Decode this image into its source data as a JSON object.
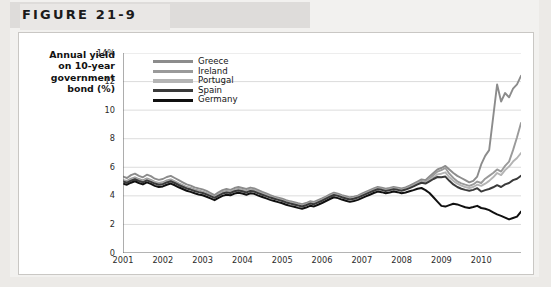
{
  "figure": {
    "label": "FIGURE 21-9"
  },
  "axis_title": {
    "line1": "Annual yield",
    "line2": "on 10-year",
    "line3": "government",
    "line4": "bond (%)"
  },
  "chart_data": {
    "type": "line",
    "title": "FIGURE 21-9",
    "xlabel": "",
    "ylabel": "Annual yield on 10-year government bond (%)",
    "ylim": [
      0,
      14
    ],
    "xlim": [
      2001,
      2011
    ],
    "grid": true,
    "legend_position": "top-left-inside",
    "ytick_labels": [
      "0",
      "2",
      "4",
      "6",
      "8",
      "10",
      "12",
      "14%"
    ],
    "ytick_values": [
      0,
      2,
      4,
      6,
      8,
      10,
      12,
      14
    ],
    "xtick_labels": [
      "2001",
      "2002",
      "2003",
      "2004",
      "2005",
      "2006",
      "2007",
      "2008",
      "2009",
      "2010"
    ],
    "xtick_values": [
      2001,
      2002,
      2003,
      2004,
      2005,
      2006,
      2007,
      2008,
      2009,
      2010
    ],
    "colors": {
      "Greece": "#8c8c8c",
      "Ireland": "#9a9a9a",
      "Portugal": "#b4b4b4",
      "Spain": "#3a3a3a",
      "Germany": "#101010"
    },
    "x": [
      2001.0,
      2001.1,
      2001.2,
      2001.3,
      2001.4,
      2001.5,
      2001.6,
      2001.7,
      2001.8,
      2001.9,
      2002.0,
      2002.1,
      2002.2,
      2002.3,
      2002.4,
      2002.5,
      2002.6,
      2002.7,
      2002.8,
      2002.9,
      2003.0,
      2003.1,
      2003.2,
      2003.3,
      2003.4,
      2003.5,
      2003.6,
      2003.7,
      2003.8,
      2003.9,
      2004.0,
      2004.1,
      2004.2,
      2004.3,
      2004.4,
      2004.5,
      2004.6,
      2004.7,
      2004.8,
      2004.9,
      2005.0,
      2005.1,
      2005.2,
      2005.3,
      2005.4,
      2005.5,
      2005.6,
      2005.7,
      2005.8,
      2005.9,
      2006.0,
      2006.1,
      2006.2,
      2006.3,
      2006.4,
      2006.5,
      2006.6,
      2006.7,
      2006.8,
      2006.9,
      2007.0,
      2007.1,
      2007.2,
      2007.3,
      2007.4,
      2007.5,
      2007.6,
      2007.7,
      2007.8,
      2007.9,
      2008.0,
      2008.1,
      2008.2,
      2008.3,
      2008.4,
      2008.5,
      2008.6,
      2008.7,
      2008.8,
      2008.9,
      2009.0,
      2009.1,
      2009.2,
      2009.3,
      2009.4,
      2009.5,
      2009.6,
      2009.7,
      2009.8,
      2009.9,
      2010.0,
      2010.1,
      2010.2,
      2010.3,
      2010.4,
      2010.5,
      2010.6,
      2010.7,
      2010.8,
      2010.9,
      2011.0
    ],
    "series": [
      {
        "name": "Greece",
        "values": [
          5.35,
          5.25,
          5.45,
          5.55,
          5.4,
          5.3,
          5.48,
          5.38,
          5.2,
          5.12,
          5.18,
          5.32,
          5.4,
          5.25,
          5.1,
          4.95,
          4.8,
          4.72,
          4.6,
          4.52,
          4.45,
          4.35,
          4.2,
          4.05,
          4.25,
          4.4,
          4.48,
          4.42,
          4.55,
          4.62,
          4.55,
          4.48,
          4.58,
          4.52,
          4.4,
          4.28,
          4.18,
          4.05,
          3.95,
          3.88,
          3.8,
          3.7,
          3.62,
          3.55,
          3.48,
          3.42,
          3.5,
          3.62,
          3.58,
          3.7,
          3.82,
          3.95,
          4.1,
          4.22,
          4.15,
          4.05,
          3.98,
          3.9,
          3.95,
          4.02,
          4.15,
          4.28,
          4.4,
          4.52,
          4.62,
          4.58,
          4.5,
          4.55,
          4.62,
          4.58,
          4.52,
          4.6,
          4.72,
          4.85,
          5.0,
          5.15,
          5.1,
          5.35,
          5.6,
          5.85,
          5.95,
          6.1,
          5.85,
          5.6,
          5.4,
          5.25,
          5.1,
          4.95,
          5.05,
          5.35,
          6.2,
          6.8,
          7.2,
          9.5,
          11.8,
          10.6,
          11.2,
          10.9,
          11.5,
          11.8,
          12.4
        ]
      },
      {
        "name": "Ireland",
        "values": [
          5.1,
          5.05,
          5.2,
          5.3,
          5.18,
          5.08,
          5.22,
          5.12,
          4.98,
          4.9,
          4.95,
          5.08,
          5.15,
          5.02,
          4.88,
          4.75,
          4.62,
          4.55,
          4.45,
          4.38,
          4.3,
          4.2,
          4.08,
          3.95,
          4.12,
          4.28,
          4.35,
          4.3,
          4.42,
          4.48,
          4.42,
          4.35,
          4.45,
          4.4,
          4.28,
          4.18,
          4.08,
          3.96,
          3.88,
          3.8,
          3.72,
          3.62,
          3.55,
          3.48,
          3.4,
          3.35,
          3.42,
          3.55,
          3.5,
          3.62,
          3.75,
          3.88,
          4.02,
          4.15,
          4.08,
          3.98,
          3.9,
          3.82,
          3.88,
          3.95,
          4.08,
          4.2,
          4.32,
          4.45,
          4.55,
          4.5,
          4.42,
          4.48,
          4.55,
          4.5,
          4.45,
          4.52,
          4.62,
          4.75,
          4.9,
          5.05,
          4.98,
          5.2,
          5.45,
          5.7,
          5.8,
          5.95,
          5.55,
          5.25,
          5.02,
          4.88,
          4.78,
          4.7,
          4.8,
          5.0,
          4.9,
          5.2,
          5.4,
          5.6,
          5.85,
          5.7,
          6.1,
          6.4,
          7.2,
          8.1,
          9.1
        ]
      },
      {
        "name": "Portugal",
        "values": [
          5.05,
          4.98,
          5.12,
          5.22,
          5.1,
          5.0,
          5.15,
          5.05,
          4.92,
          4.85,
          4.88,
          5.0,
          5.08,
          4.95,
          4.82,
          4.7,
          4.58,
          4.5,
          4.4,
          4.32,
          4.25,
          4.15,
          4.02,
          3.9,
          4.08,
          4.22,
          4.3,
          4.25,
          4.38,
          4.44,
          4.38,
          4.3,
          4.4,
          4.35,
          4.24,
          4.14,
          4.04,
          3.92,
          3.84,
          3.76,
          3.68,
          3.58,
          3.5,
          3.44,
          3.36,
          3.3,
          3.38,
          3.5,
          3.45,
          3.58,
          3.7,
          3.84,
          3.98,
          4.1,
          4.04,
          3.94,
          3.86,
          3.78,
          3.84,
          3.92,
          4.04,
          4.16,
          4.28,
          4.4,
          4.5,
          4.46,
          4.38,
          4.44,
          4.5,
          4.46,
          4.4,
          4.48,
          4.58,
          4.7,
          4.85,
          4.98,
          4.92,
          5.1,
          5.3,
          5.5,
          5.55,
          5.65,
          5.3,
          5.05,
          4.85,
          4.72,
          4.62,
          4.55,
          4.62,
          4.78,
          4.7,
          4.85,
          5.05,
          5.3,
          5.6,
          5.45,
          5.8,
          6.05,
          6.4,
          6.65,
          7.0
        ]
      },
      {
        "name": "Spain",
        "values": [
          5.0,
          4.92,
          5.06,
          5.16,
          5.05,
          4.95,
          5.08,
          4.98,
          4.86,
          4.78,
          4.82,
          4.94,
          5.02,
          4.9,
          4.76,
          4.64,
          4.52,
          4.44,
          4.34,
          4.26,
          4.2,
          4.1,
          3.98,
          3.86,
          4.02,
          4.16,
          4.24,
          4.2,
          4.32,
          4.38,
          4.32,
          4.24,
          4.34,
          4.3,
          4.18,
          4.08,
          3.98,
          3.88,
          3.8,
          3.72,
          3.64,
          3.54,
          3.46,
          3.4,
          3.32,
          3.26,
          3.34,
          3.46,
          3.42,
          3.54,
          3.66,
          3.8,
          3.94,
          4.06,
          4.0,
          3.9,
          3.82,
          3.74,
          3.8,
          3.88,
          4.0,
          4.12,
          4.24,
          4.36,
          4.46,
          4.42,
          4.34,
          4.4,
          4.46,
          4.42,
          4.36,
          4.44,
          4.54,
          4.66,
          4.8,
          4.92,
          4.86,
          5.02,
          5.18,
          5.32,
          5.3,
          5.35,
          5.05,
          4.8,
          4.62,
          4.5,
          4.42,
          4.36,
          4.42,
          4.54,
          4.3,
          4.4,
          4.48,
          4.6,
          4.75,
          4.62,
          4.8,
          4.9,
          5.1,
          5.2,
          5.4
        ]
      },
      {
        "name": "Germany",
        "values": [
          4.85,
          4.78,
          4.92,
          5.02,
          4.9,
          4.8,
          4.94,
          4.84,
          4.7,
          4.62,
          4.66,
          4.78,
          4.86,
          4.74,
          4.6,
          4.48,
          4.36,
          4.28,
          4.18,
          4.1,
          4.04,
          3.94,
          3.82,
          3.7,
          3.86,
          4.0,
          4.08,
          4.04,
          4.16,
          4.22,
          4.16,
          4.08,
          4.18,
          4.14,
          4.02,
          3.92,
          3.82,
          3.72,
          3.64,
          3.56,
          3.48,
          3.38,
          3.3,
          3.24,
          3.16,
          3.1,
          3.18,
          3.3,
          3.26,
          3.38,
          3.5,
          3.64,
          3.78,
          3.9,
          3.84,
          3.74,
          3.66,
          3.58,
          3.64,
          3.72,
          3.84,
          3.96,
          4.08,
          4.2,
          4.3,
          4.26,
          4.18,
          4.24,
          4.3,
          4.26,
          4.18,
          4.24,
          4.32,
          4.4,
          4.5,
          4.55,
          4.4,
          4.2,
          3.9,
          3.6,
          3.3,
          3.25,
          3.35,
          3.45,
          3.4,
          3.3,
          3.2,
          3.15,
          3.22,
          3.3,
          3.15,
          3.1,
          3.0,
          2.85,
          2.7,
          2.6,
          2.48,
          2.35,
          2.45,
          2.55,
          2.9
        ]
      }
    ]
  },
  "legend": [
    {
      "label": "Greece",
      "color": "#8c8c8c"
    },
    {
      "label": "Ireland",
      "color": "#9a9a9a"
    },
    {
      "label": "Portugal",
      "color": "#b4b4b4"
    },
    {
      "label": "Spain",
      "color": "#3a3a3a"
    },
    {
      "label": "Germany",
      "color": "#101010"
    }
  ]
}
